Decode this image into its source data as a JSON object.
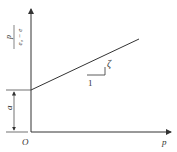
{
  "diagram": {
    "y_axis_label": {
      "numerator": "p",
      "denominator": "e₀ − e"
    },
    "x_axis_label": "p",
    "origin_label": "O",
    "intercept_label": "a",
    "slope_run_label": "1",
    "slope_rise_label": "ζ",
    "colors": {
      "stroke": "#333333",
      "background": "#ffffff"
    }
  }
}
